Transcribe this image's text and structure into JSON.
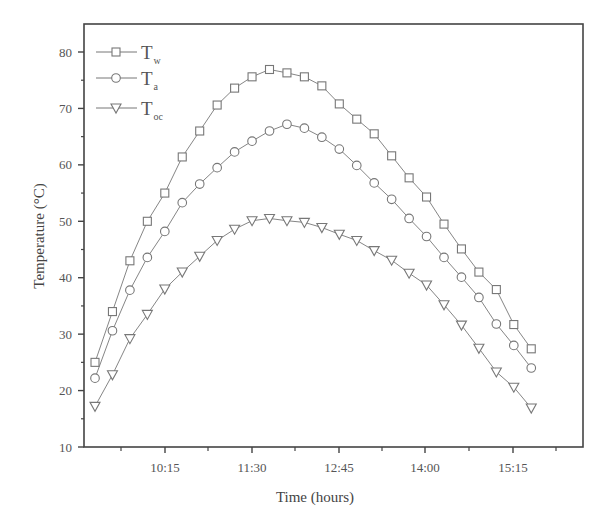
{
  "chart_data": {
    "type": "line",
    "title": "",
    "xlabel": "Time (hours)",
    "ylabel": "Temperature (°C)",
    "ylim": [
      10,
      85
    ],
    "yticks": [
      10,
      20,
      30,
      40,
      50,
      60,
      70,
      80
    ],
    "xtick_labels": [
      "10:15",
      "11:30",
      "12:45",
      "14:00",
      "15:15"
    ],
    "grid": false,
    "legend_position": "upper-left",
    "x": [
      "9:15",
      "9:30",
      "9:45",
      "10:00",
      "10:15",
      "10:30",
      "10:45",
      "11:00",
      "11:15",
      "11:30",
      "11:45",
      "12:00",
      "12:15",
      "12:30",
      "12:45",
      "13:00",
      "13:15",
      "13:30",
      "13:45",
      "14:00",
      "14:15",
      "14:30",
      "14:45",
      "15:00",
      "15:15",
      "15:30"
    ],
    "series": [
      {
        "name": "T_w",
        "label_main": "T",
        "label_sub": "w",
        "marker": "square",
        "values": [
          25.0,
          34.0,
          43.0,
          50.0,
          55.0,
          61.4,
          66.0,
          70.6,
          73.6,
          75.6,
          76.9,
          76.3,
          75.6,
          74.0,
          70.8,
          68.1,
          65.5,
          61.6,
          57.7,
          54.3,
          49.5,
          45.1,
          41.0,
          37.9,
          31.7,
          27.4
        ]
      },
      {
        "name": "T_a",
        "label_main": "T",
        "label_sub": "a",
        "marker": "circle",
        "values": [
          22.2,
          30.6,
          37.8,
          43.6,
          48.2,
          53.3,
          56.6,
          59.5,
          62.3,
          64.2,
          66.0,
          67.2,
          66.5,
          64.9,
          62.8,
          59.9,
          56.8,
          53.9,
          50.5,
          47.3,
          43.6,
          40.1,
          36.5,
          31.8,
          28.0,
          24.0
        ]
      },
      {
        "name": "T_oc",
        "label_main": "T",
        "label_sub": "oc",
        "marker": "triangle-down",
        "values": [
          17.2,
          22.8,
          29.2,
          33.5,
          38.0,
          41.0,
          43.8,
          46.6,
          48.6,
          50.1,
          50.5,
          50.1,
          49.8,
          48.9,
          47.7,
          46.6,
          44.8,
          43.1,
          40.8,
          38.7,
          35.2,
          31.6,
          27.5,
          23.3,
          20.6,
          16.9
        ]
      }
    ],
    "colors": {
      "line": "#777777",
      "axis": "#444444",
      "marker_fill": "#ffffff"
    }
  }
}
